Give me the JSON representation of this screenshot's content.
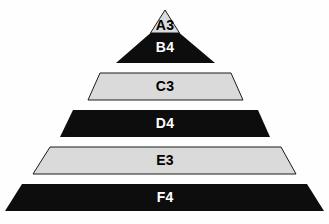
{
  "diagram": {
    "type": "pyramid",
    "title": "",
    "background_color": "#fefefe",
    "orientation": "apex-top",
    "tier_count": 6,
    "style": {
      "dark_fill": "#0d0d0d",
      "light_fill": "#dadada",
      "dark_text": "#000000",
      "light_text": "#ffffff",
      "outline_color": "#1a1a1a",
      "outline_width": 1
    },
    "tiers": [
      {
        "id": "tier-a3",
        "label": "A3",
        "level": 1,
        "fill": "#dadada",
        "text_color": "#000000",
        "shape": "triangle-apex",
        "outlined": true,
        "points": "165,10 150.5,33 179.5,33",
        "label_x": 165,
        "label_y": 26
      },
      {
        "id": "tier-b4",
        "label": "B4",
        "level": 2,
        "fill": "#0d0d0d",
        "text_color": "#ffffff",
        "shape": "trapezoid",
        "outlined": false,
        "points": "150.5,33 179.5,33 215,63 116,63",
        "label_x": 165,
        "label_y": 48
      },
      {
        "id": "tier-c3",
        "label": "C3",
        "level": 3,
        "fill": "#dadada",
        "text_color": "#000000",
        "shape": "trapezoid",
        "outlined": true,
        "points": "100,73 231,73 243,100 88,100",
        "label_x": 165,
        "label_y": 87
      },
      {
        "id": "tier-d4",
        "label": "D4",
        "level": 4,
        "fill": "#0d0d0d",
        "text_color": "#ffffff",
        "shape": "trapezoid",
        "outlined": false,
        "points": "73,110 258,110 270,137 60,137",
        "label_x": 165,
        "label_y": 124
      },
      {
        "id": "tier-e3",
        "label": "E3",
        "level": 5,
        "fill": "#dadada",
        "text_color": "#000000",
        "shape": "trapezoid",
        "outlined": true,
        "points": "50,147 281,147 296,174 33,174",
        "label_x": 165,
        "label_y": 161
      },
      {
        "id": "tier-f4",
        "label": "F4",
        "level": 6,
        "fill": "#0d0d0d",
        "text_color": "#ffffff",
        "shape": "trapezoid",
        "outlined": false,
        "points": "22,184 307,184 324,211 5,211",
        "label_x": 165,
        "label_y": 198
      }
    ]
  }
}
